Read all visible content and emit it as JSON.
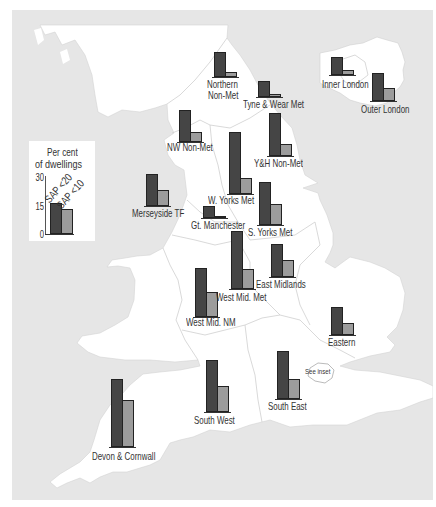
{
  "colors": {
    "sap_lt20": "#454545",
    "sap_lt10": "#9c9c9c",
    "sea": "#e6e6e6",
    "land": "#ffffff"
  },
  "figure": {
    "legend": {
      "title_line1": "Per cent",
      "title_line2": "of dwellings",
      "ticks": [
        "30",
        "15",
        "0"
      ],
      "series_labels": [
        "SAP <20",
        "SAP <10"
      ]
    },
    "inset_note": "See inset",
    "labels": {
      "northern_1": "Northern",
      "northern_2": "Non-Met",
      "tyne_wear": "Tyne & Wear Met",
      "inner_london": "Inner London",
      "outer_london": "Outer London",
      "nw_nonmet": "NW Non-Met",
      "yh_nonmet": "Y&H Non-Met",
      "w_yorks": "W. Yorks Met",
      "merseyside": "Merseyside TF",
      "gt_manchester": "Gt. Manchester",
      "s_yorks": "S. Yorks Met",
      "east_midlands": "East Midlands",
      "west_mid_met": "West Mid. Met",
      "west_mid_nm": "West Mid. NM",
      "eastern": "Eastern",
      "south_east": "South East",
      "south_west": "South West",
      "devon_cornwall": "Devon & Cornwall"
    }
  },
  "chart_data": {
    "type": "bar",
    "title": "",
    "subtitle": "",
    "xlabel": "",
    "ylabel": "Per cent of dwellings",
    "ylim": [
      0,
      30
    ],
    "yticks": [
      0,
      15,
      30
    ],
    "grid": false,
    "legend_position": "left (inset box)",
    "legend_example_values": {
      "SAP <20": 15.5,
      "SAP <10": 12.5
    },
    "categories": [
      "Northern Non-Met",
      "Tyne & Wear Met",
      "Inner London",
      "Outer London",
      "NW Non-Met",
      "Y&H Non-Met",
      "W. Yorks Met",
      "Merseyside TF",
      "Gt. Manchester",
      "S. Yorks Met",
      "East Midlands",
      "West Mid. Met",
      "West Mid. NM",
      "Eastern",
      "South West",
      "South East",
      "Devon & Cornwall"
    ],
    "series": [
      {
        "name": "SAP <20",
        "values": [
          12.5,
          8,
          9,
          14,
          16,
          22,
          31.5,
          16,
          6,
          22,
          17,
          29.5,
          25,
          14,
          26.5,
          24.5,
          34.5
        ]
      },
      {
        "name": "SAP <10",
        "values": [
          2.5,
          1.5,
          2.5,
          6.5,
          5,
          6,
          8,
          8,
          0.5,
          10.5,
          8.5,
          10,
          12.5,
          6,
          13,
          10,
          24
        ]
      }
    ]
  }
}
